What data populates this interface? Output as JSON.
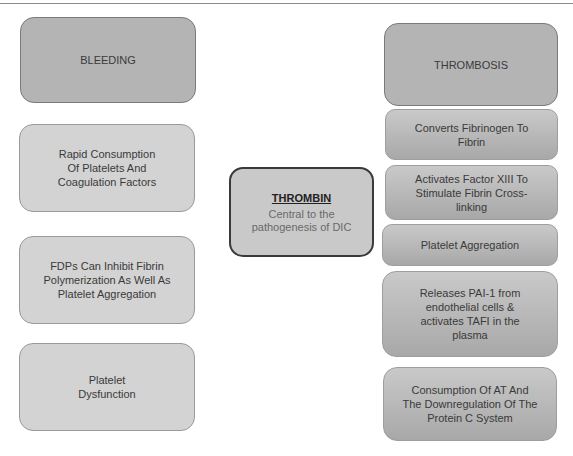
{
  "left_column": {
    "header": "BLEEDING",
    "items": [
      "Rapid Consumption Of Platelets And Coagulation Factors",
      "FDPs Can Inhibit Fibrin Polymerization As Well As Platelet Aggregation",
      "Platelet Dysfunction"
    ]
  },
  "center": {
    "title": "THROMBIN",
    "subtitle": "Central to the pathogenesis of DIC"
  },
  "right_column": {
    "header": "THROMBOSIS",
    "items": [
      "Converts Fibrinogen To Fibrin",
      "Activates Factor XIII To Stimulate Fibrin Cross-linking",
      "Platelet Aggregation",
      "Releases PAI-1 from endothelial cells & activates TAFI in the plasma",
      "Consumption Of AT And The Downregulation Of The Protein C System"
    ]
  }
}
